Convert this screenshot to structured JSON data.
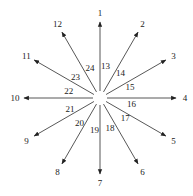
{
  "diagram": {
    "center": [
      100,
      98
    ],
    "inner_radius": 7,
    "outer_radius": 76,
    "outer_label_radius": 85,
    "inner_label_radius": 32,
    "arrow_color": "#444444",
    "arrows": [
      {
        "id": 1,
        "angle": 90
      },
      {
        "id": 2,
        "angle": 60
      },
      {
        "id": 3,
        "angle": 30
      },
      {
        "id": 4,
        "angle": 0
      },
      {
        "id": 5,
        "angle": -30
      },
      {
        "id": 6,
        "angle": -60
      },
      {
        "id": 7,
        "angle": -90
      },
      {
        "id": 8,
        "angle": -120
      },
      {
        "id": 9,
        "angle": -150
      },
      {
        "id": 10,
        "angle": 180
      },
      {
        "id": 11,
        "angle": 150
      },
      {
        "id": 12,
        "angle": 120
      }
    ],
    "inner_labels": [
      {
        "text": "13",
        "angle": 80
      },
      {
        "text": "14",
        "angle": 50
      },
      {
        "text": "15",
        "angle": 20
      },
      {
        "text": "16",
        "angle": -10
      },
      {
        "text": "17",
        "angle": -38
      },
      {
        "text": "18",
        "angle": -72
      },
      {
        "text": "19",
        "angle": -100
      },
      {
        "text": "20",
        "angle": -130
      },
      {
        "text": "21",
        "angle": -160
      },
      {
        "text": "22",
        "angle": 168
      },
      {
        "text": "23",
        "angle": 140
      },
      {
        "text": "24",
        "angle": 108
      }
    ]
  }
}
